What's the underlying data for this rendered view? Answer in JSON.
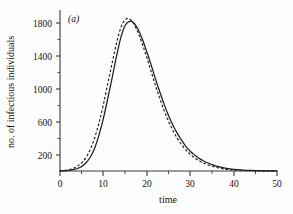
{
  "figure": {
    "panel_label": "(a)",
    "background_color": "#fdfdfd",
    "ink_color": "#1c1c1c"
  },
  "chart_data": {
    "type": "line",
    "title": "",
    "subtitle": "",
    "panel_label": "(a)",
    "xlabel": "time",
    "ylabel": "no. of infectious individuals",
    "xlim": [
      0,
      50
    ],
    "ylim": [
      0,
      2000
    ],
    "grid": false,
    "legend": null,
    "legend_position": "none",
    "x_ticks_major": [
      0,
      10,
      20,
      30,
      40,
      50
    ],
    "x_tick_labels": [
      "0",
      "10",
      "20",
      "30",
      "40",
      "50"
    ],
    "x_ticks_minor": [
      5,
      15,
      25,
      35,
      45
    ],
    "y_ticks_major": [
      200,
      600,
      1000,
      1400,
      1800
    ],
    "y_tick_labels": [
      "200",
      "600",
      "1000",
      "1400",
      "1800"
    ],
    "y_ticks_minor": [
      400,
      800,
      1200,
      1600
    ],
    "x": [
      0,
      1,
      2,
      3,
      4,
      5,
      6,
      7,
      8,
      9,
      10,
      11,
      12,
      13,
      14,
      15,
      16,
      17,
      18,
      19,
      20,
      21,
      22,
      23,
      24,
      25,
      26,
      27,
      28,
      29,
      30,
      31,
      32,
      33,
      34,
      35,
      36,
      37,
      38,
      39,
      40,
      42,
      44,
      46,
      48,
      50
    ],
    "series": [
      {
        "name": "solid-curve",
        "style": "solid",
        "color": "#1c1c1c",
        "peak_x": 16.5,
        "peak_y": 1820,
        "values": [
          2,
          4,
          8,
          16,
          30,
          55,
          100,
          170,
          280,
          440,
          640,
          880,
          1130,
          1390,
          1620,
          1770,
          1820,
          1800,
          1720,
          1600,
          1450,
          1290,
          1120,
          960,
          810,
          675,
          560,
          460,
          375,
          300,
          240,
          195,
          155,
          125,
          100,
          78,
          60,
          46,
          35,
          27,
          20,
          12,
          7,
          4,
          2,
          1
        ]
      },
      {
        "name": "dashed-curve",
        "style": "dashed",
        "color": "#1c1c1c",
        "peak_x": 15.8,
        "peak_y": 1855,
        "values": [
          3,
          7,
          15,
          30,
          58,
          100,
          165,
          265,
          405,
          590,
          810,
          1060,
          1310,
          1550,
          1740,
          1840,
          1850,
          1790,
          1680,
          1540,
          1380,
          1210,
          1040,
          880,
          735,
          605,
          495,
          400,
          322,
          256,
          202,
          160,
          125,
          98,
          76,
          58,
          44,
          33,
          24,
          18,
          13,
          7,
          4,
          2,
          1,
          0
        ]
      }
    ]
  },
  "axes": {
    "x_title": "time",
    "y_title": "no. of infectious individuals"
  }
}
